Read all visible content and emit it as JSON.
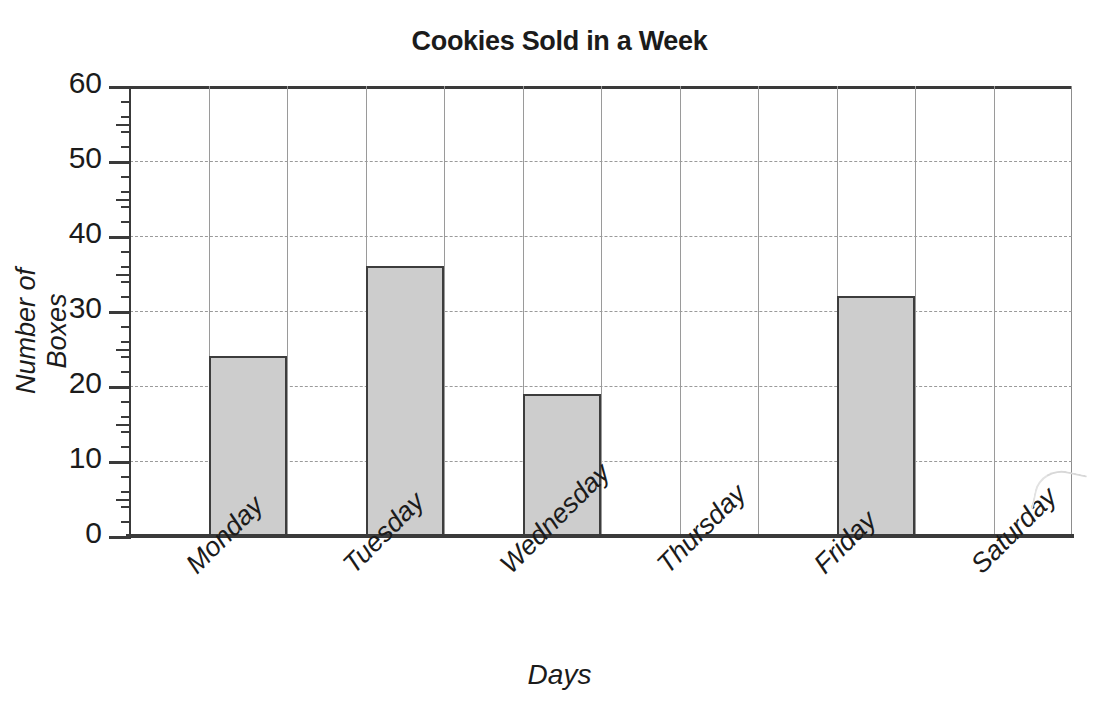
{
  "chart_data": {
    "type": "bar",
    "title": "Cookies Sold in a Week",
    "xlabel": "Days",
    "ylabel": "Number of Boxes",
    "categories": [
      "Monday",
      "Tuesday",
      "Wednesday",
      "Thursday",
      "Friday",
      "Saturday"
    ],
    "values": [
      24,
      36,
      19,
      0,
      32,
      0
    ],
    "ylim": [
      0,
      60
    ],
    "ytick_labels": [
      "0",
      "10",
      "20",
      "30",
      "40",
      "50",
      "60"
    ],
    "ytick_values": [
      0,
      10,
      20,
      30,
      40,
      50,
      60
    ],
    "y_major_step": 10,
    "y_minor_step": 2,
    "grid": "both",
    "legend": "none",
    "bar_fill_color": "#cdcdcd",
    "bar_edge_color": "#3d3d3d",
    "grid_color": "#9a9a9a",
    "axis_color": "#3a3a3a",
    "text_color": "#1b1b1b",
    "background_color": "#ffffff",
    "xtick_label_rotation": -45
  }
}
